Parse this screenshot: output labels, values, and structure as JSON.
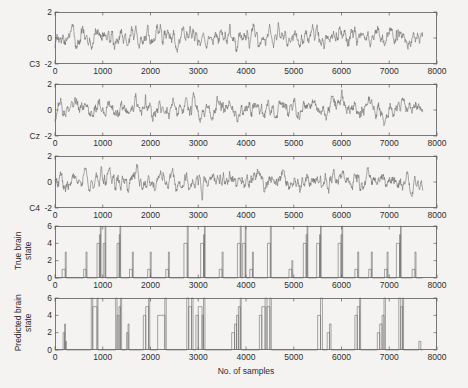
{
  "figure": {
    "background_color": "#f4f3f1",
    "axis_color": "#5a5a5a",
    "trace_color": "#6f6f6f",
    "xlabel": "No. of samples"
  },
  "chart_data": {
    "type": "line",
    "title": "",
    "xlabel": "No. of samples",
    "ylabel": "",
    "xlim": [
      0,
      8000
    ],
    "grid": false,
    "legend": "none",
    "shared_x_ticks": [
      0,
      1000,
      2000,
      3000,
      4000,
      5000,
      6000,
      7000,
      8000
    ],
    "shared_x_tick_labels": [
      "0",
      "1000",
      "2000",
      "3000",
      "4000",
      "5000",
      "6000",
      "7000",
      "8000"
    ],
    "data_end_x": 7700,
    "panels": [
      {
        "name": "C3",
        "label": "C3",
        "label_type": "left-of-axis",
        "ylim": [
          -2,
          2
        ],
        "yticks": [
          -2,
          0,
          2
        ],
        "ytick_labels": [
          "-2",
          "0",
          "2"
        ],
        "series_type": "eeg-trace",
        "ylabel": "",
        "values": [
          0.02,
          -0.18,
          0.1,
          -0.05,
          0.3,
          -0.12,
          0.08,
          -0.3,
          0.25,
          0.05,
          -0.22,
          0.35,
          -0.1,
          0.15,
          -0.35,
          0.2,
          0.45,
          -0.05,
          0.28,
          -0.4,
          0.12,
          0.5,
          0.18,
          -0.25,
          0.6,
          0.22,
          -0.15,
          0.4,
          0.75,
          0.3,
          -0.1,
          0.55,
          0.2,
          -0.45,
          0.15,
          0.62,
          0.28,
          -0.2,
          0.48,
          0.1,
          -0.55,
          0.3,
          0.7,
          0.25,
          -0.3,
          0.45,
          0.15,
          -0.6,
          0.2,
          0.55,
          0.35,
          -0.15,
          0.65,
          0.25,
          -0.4,
          0.3,
          0.8,
          0.4,
          -0.1,
          0.5,
          0.2,
          -0.5,
          0.25,
          0.6,
          0.3,
          -0.25,
          0.45,
          0.1,
          -0.65,
          0.35,
          0.75,
          0.2,
          -0.3,
          0.55,
          0.15,
          -0.45,
          0.4,
          0.85,
          0.3,
          -0.2,
          0.6,
          0.25,
          -0.55,
          0.2,
          0.7,
          0.35,
          -0.15,
          0.5,
          0.18,
          -0.6,
          0.3,
          0.65,
          0.22,
          -0.35,
          0.48,
          0.12,
          -0.5,
          0.28,
          0.9,
          1.2,
          0.6,
          0.1,
          -0.3,
          0.4,
          0.75,
          0.25,
          -0.4,
          0.5,
          0.2,
          -0.55,
          0.35,
          0.68,
          0.3,
          -0.2,
          0.55,
          0.15,
          -0.6,
          0.25,
          0.72,
          0.4,
          -0.1,
          0.6,
          0.2,
          -0.45,
          0.3,
          0.8,
          0.35,
          -0.25,
          0.5,
          0.18,
          -0.55,
          0.28,
          0.65,
          0.3,
          -0.3,
          0.45,
          0.12,
          -0.5,
          0.35,
          1.35,
          0.9,
          0.3,
          -0.2,
          0.5,
          0.2,
          -0.6,
          0.3,
          0.7,
          0.25,
          -0.35,
          0.55,
          0.15,
          -0.5,
          0.4,
          0.78,
          0.3,
          -0.2,
          0.6,
          0.22,
          -0.55,
          0.25,
          0.68,
          0.35,
          -0.3,
          0.48,
          0.1,
          -0.6,
          0.3,
          0.72,
          0.28,
          -0.25,
          0.52,
          0.18,
          -0.5,
          0.35,
          0.8,
          0.3,
          -0.15,
          0.58,
          0.2,
          -0.55,
          0.28,
          0.66,
          0.32,
          -0.3,
          0.46,
          0.14,
          -0.48,
          0.3,
          0.74,
          0.26,
          -0.2,
          0.56,
          0.16,
          -0.58,
          0.26,
          0.7,
          0.34,
          -0.28,
          0.5,
          0.12,
          -0.52,
          0.32,
          0.76,
          0.28,
          -0.22,
          0.54,
          0.2,
          -0.6,
          0.3,
          0.68,
          0.3,
          -0.3,
          0.48,
          0.15,
          -0.5,
          0.34,
          1.6,
          1.1,
          0.4,
          -0.15,
          0.55,
          0.2,
          -0.6,
          0.3,
          0.7,
          0.26,
          -0.35,
          0.5,
          0.16,
          -0.55,
          0.36,
          0.76,
          0.3,
          -0.24,
          0.58,
          0.2,
          -0.56,
          0.28,
          0.66,
          0.33,
          -0.3,
          0.46,
          0.12,
          -0.58,
          0.32,
          0.72,
          0.27,
          -0.26,
          0.52,
          0.18,
          -0.5,
          0.34,
          0.78,
          0.29,
          -0.18,
          0.56,
          0.21,
          -0.54,
          0.27,
          0.64,
          0.31,
          -0.32,
          0.44,
          0.13,
          -0.46,
          0.31,
          0.73,
          0.25,
          -0.22,
          0.55,
          0.17,
          -0.57,
          0.27,
          0.69,
          0.33,
          -0.29,
          0.49,
          0.11,
          -0.51,
          0.31,
          0.75,
          0.27,
          -0.23,
          0.53,
          0.19,
          -0.59,
          0.29,
          0.67,
          0.29,
          -0.31,
          0.47,
          0.14,
          -0.49,
          0.33
        ],
        "data_characteristics": {
          "mean": 0.15,
          "std": 0.42,
          "range": [
            -1.3,
            1.75
          ],
          "n_samples": 7700,
          "description": "Band-limited noisy EEG oscillation centered near 0 with intermittent high-amplitude bursts"
        }
      },
      {
        "name": "Cz",
        "label": "Cz",
        "label_type": "left-of-axis",
        "ylim": [
          -2,
          2
        ],
        "yticks": [
          -2,
          0,
          2
        ],
        "ytick_labels": [
          "-2",
          "0",
          "2"
        ],
        "series_type": "eeg-trace",
        "ylabel": "",
        "data_characteristics": {
          "mean": 0.12,
          "std": 0.4,
          "range": [
            -1.25,
            1.7
          ],
          "n_samples": 7700,
          "description": "Similar EEG morphology to C3 with a prominent burst near sample 2900"
        }
      },
      {
        "name": "C4",
        "label": "C4",
        "label_type": "left-of-axis",
        "ylim": [
          -2,
          2
        ],
        "yticks": [
          -2,
          0,
          2
        ],
        "ytick_labels": [
          "-2",
          "0",
          "2"
        ],
        "series_type": "eeg-trace",
        "ylabel": "",
        "data_characteristics": {
          "mean": 0.1,
          "std": 0.44,
          "range": [
            -1.35,
            1.65
          ],
          "n_samples": 7700,
          "description": "EEG trace with strong deflections near samples 2800-3200"
        }
      },
      {
        "name": "true-brain-state",
        "label": "True brain state",
        "label_line1": "True brain",
        "label_line2": "state",
        "label_type": "rotated-ylabel",
        "ylim": [
          0,
          6
        ],
        "yticks": [
          0,
          2,
          4,
          6
        ],
        "ytick_labels": [
          "0",
          "2",
          "4",
          "6"
        ],
        "series_type": "step",
        "description": "Clean rectangular state pulses alternating between baseline 0 and levels 1-5",
        "pulses": [
          {
            "start": 150,
            "end": 215,
            "level": 1
          },
          {
            "start": 215,
            "end": 235,
            "level": 3
          },
          {
            "start": 600,
            "end": 650,
            "level": 1
          },
          {
            "start": 650,
            "end": 670,
            "level": 3
          },
          {
            "start": 880,
            "end": 930,
            "level": 4
          },
          {
            "start": 930,
            "end": 950,
            "level": 5
          },
          {
            "start": 950,
            "end": 965,
            "level": 6
          },
          {
            "start": 1010,
            "end": 1050,
            "level": 4
          },
          {
            "start": 1050,
            "end": 1065,
            "level": 6
          },
          {
            "start": 1300,
            "end": 1345,
            "level": 4
          },
          {
            "start": 1345,
            "end": 1360,
            "level": 5
          },
          {
            "start": 1360,
            "end": 1375,
            "level": 6
          },
          {
            "start": 1560,
            "end": 1620,
            "level": 1
          },
          {
            "start": 1620,
            "end": 1640,
            "level": 3
          },
          {
            "start": 1940,
            "end": 1995,
            "level": 1
          },
          {
            "start": 1995,
            "end": 2015,
            "level": 3
          },
          {
            "start": 2320,
            "end": 2375,
            "level": 1
          },
          {
            "start": 2375,
            "end": 2395,
            "level": 3
          },
          {
            "start": 2700,
            "end": 2770,
            "level": 4
          },
          {
            "start": 2770,
            "end": 2790,
            "level": 6
          },
          {
            "start": 3050,
            "end": 3110,
            "level": 4
          },
          {
            "start": 3110,
            "end": 3130,
            "level": 5
          },
          {
            "start": 3130,
            "end": 3145,
            "level": 6
          },
          {
            "start": 3440,
            "end": 3500,
            "level": 1
          },
          {
            "start": 3500,
            "end": 3520,
            "level": 3
          },
          {
            "start": 3820,
            "end": 3880,
            "level": 4
          },
          {
            "start": 3880,
            "end": 3900,
            "level": 6
          },
          {
            "start": 3930,
            "end": 3985,
            "level": 4
          },
          {
            "start": 3985,
            "end": 4000,
            "level": 6
          },
          {
            "start": 4080,
            "end": 4135,
            "level": 1
          },
          {
            "start": 4135,
            "end": 4155,
            "level": 3
          },
          {
            "start": 4450,
            "end": 4510,
            "level": 4
          },
          {
            "start": 4510,
            "end": 4530,
            "level": 6
          },
          {
            "start": 4900,
            "end": 4960,
            "level": 1
          },
          {
            "start": 4960,
            "end": 4980,
            "level": 2
          },
          {
            "start": 5200,
            "end": 5260,
            "level": 4
          },
          {
            "start": 5260,
            "end": 5280,
            "level": 5
          },
          {
            "start": 5280,
            "end": 5295,
            "level": 6
          },
          {
            "start": 5480,
            "end": 5540,
            "level": 4
          },
          {
            "start": 5540,
            "end": 5560,
            "level": 5
          },
          {
            "start": 5560,
            "end": 5575,
            "level": 6
          },
          {
            "start": 5930,
            "end": 5990,
            "level": 4
          },
          {
            "start": 5990,
            "end": 6010,
            "level": 5
          },
          {
            "start": 6010,
            "end": 6025,
            "level": 6
          },
          {
            "start": 6280,
            "end": 6340,
            "level": 1
          },
          {
            "start": 6340,
            "end": 6360,
            "level": 3
          },
          {
            "start": 6570,
            "end": 6625,
            "level": 1
          },
          {
            "start": 6625,
            "end": 6645,
            "level": 3
          },
          {
            "start": 6900,
            "end": 6955,
            "level": 1
          },
          {
            "start": 6955,
            "end": 6975,
            "level": 3
          },
          {
            "start": 7150,
            "end": 7215,
            "level": 4
          },
          {
            "start": 7215,
            "end": 7235,
            "level": 5
          },
          {
            "start": 7235,
            "end": 7250,
            "level": 6
          },
          {
            "start": 7480,
            "end": 7540,
            "level": 1
          },
          {
            "start": 7540,
            "end": 7560,
            "level": 3
          }
        ]
      },
      {
        "name": "predicted-brain-state",
        "label": "Predicted brain state",
        "label_line1": "Predicted brain",
        "label_line2": "state",
        "label_type": "rotated-ylabel",
        "ylim": [
          0,
          6
        ],
        "yticks": [
          0,
          2,
          4,
          6
        ],
        "ytick_labels": [
          "0",
          "2",
          "4",
          "6"
        ],
        "series_type": "step",
        "description": "Noisier predicted state sequence with erratic transitions, extra spurious pulses and misclassified segments compared to the true state",
        "pulses": [
          {
            "start": 170,
            "end": 200,
            "level": 2
          },
          {
            "start": 200,
            "end": 220,
            "level": 3
          },
          {
            "start": 220,
            "end": 240,
            "level": 1
          },
          {
            "start": 760,
            "end": 790,
            "level": 6
          },
          {
            "start": 790,
            "end": 880,
            "level": 5
          },
          {
            "start": 880,
            "end": 900,
            "level": 6
          },
          {
            "start": 1270,
            "end": 1300,
            "level": 6
          },
          {
            "start": 1300,
            "end": 1340,
            "level": 4
          },
          {
            "start": 1340,
            "end": 1370,
            "level": 5
          },
          {
            "start": 1370,
            "end": 1395,
            "level": 6
          },
          {
            "start": 1500,
            "end": 1530,
            "level": 2
          },
          {
            "start": 1530,
            "end": 1550,
            "level": 3
          },
          {
            "start": 1850,
            "end": 1900,
            "level": 4
          },
          {
            "start": 1900,
            "end": 1960,
            "level": 5
          },
          {
            "start": 1960,
            "end": 1985,
            "level": 6
          },
          {
            "start": 2150,
            "end": 2300,
            "level": 4
          },
          {
            "start": 2300,
            "end": 2330,
            "level": 6
          },
          {
            "start": 2760,
            "end": 2800,
            "level": 6
          },
          {
            "start": 2800,
            "end": 2860,
            "level": 5
          },
          {
            "start": 2860,
            "end": 2890,
            "level": 6
          },
          {
            "start": 2950,
            "end": 3000,
            "level": 4
          },
          {
            "start": 3000,
            "end": 3080,
            "level": 5
          },
          {
            "start": 3080,
            "end": 3110,
            "level": 4
          },
          {
            "start": 3110,
            "end": 3140,
            "level": 6
          },
          {
            "start": 3700,
            "end": 3760,
            "level": 2
          },
          {
            "start": 3760,
            "end": 3800,
            "level": 3
          },
          {
            "start": 3800,
            "end": 3840,
            "level": 4
          },
          {
            "start": 3840,
            "end": 3880,
            "level": 5
          },
          {
            "start": 3880,
            "end": 3900,
            "level": 6
          },
          {
            "start": 4280,
            "end": 4330,
            "level": 4
          },
          {
            "start": 4330,
            "end": 4400,
            "level": 5
          },
          {
            "start": 4400,
            "end": 4440,
            "level": 6
          },
          {
            "start": 4440,
            "end": 4500,
            "level": 5
          },
          {
            "start": 4500,
            "end": 4530,
            "level": 6
          },
          {
            "start": 5500,
            "end": 5560,
            "level": 4
          },
          {
            "start": 5560,
            "end": 5600,
            "level": 6
          },
          {
            "start": 5700,
            "end": 5750,
            "level": 2
          },
          {
            "start": 5750,
            "end": 5780,
            "level": 3
          },
          {
            "start": 6280,
            "end": 6330,
            "level": 4
          },
          {
            "start": 6330,
            "end": 6380,
            "level": 5
          },
          {
            "start": 6380,
            "end": 6400,
            "level": 6
          },
          {
            "start": 6750,
            "end": 6800,
            "level": 2
          },
          {
            "start": 6800,
            "end": 6850,
            "level": 3
          },
          {
            "start": 6850,
            "end": 6890,
            "level": 4
          },
          {
            "start": 6890,
            "end": 6920,
            "level": 6
          },
          {
            "start": 7200,
            "end": 7240,
            "level": 6
          },
          {
            "start": 7240,
            "end": 7280,
            "level": 5
          },
          {
            "start": 7280,
            "end": 7300,
            "level": 6
          },
          {
            "start": 7620,
            "end": 7660,
            "level": 1
          }
        ]
      }
    ]
  }
}
